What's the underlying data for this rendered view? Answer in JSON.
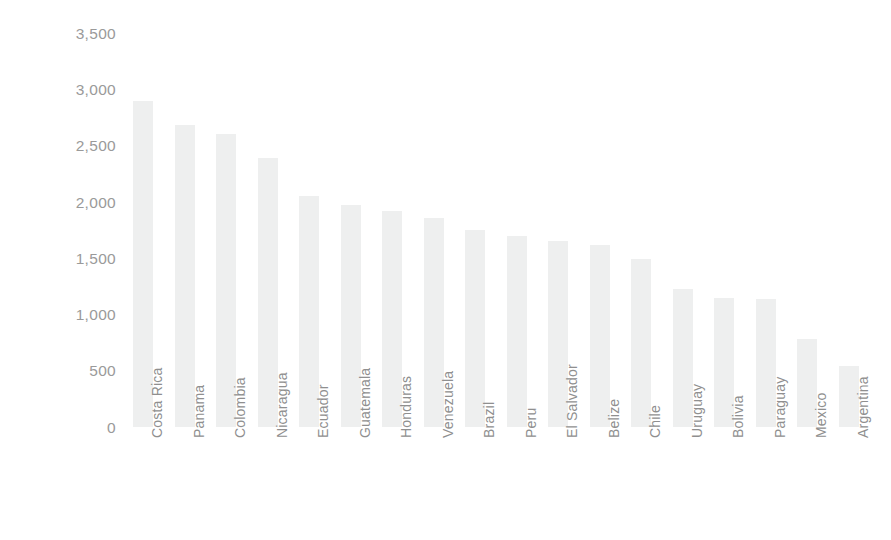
{
  "chart_data": {
    "type": "bar",
    "title": "",
    "xlabel": "",
    "ylabel": "Rainfall (mm/yr)",
    "ylim": [
      0,
      3500
    ],
    "ytick_step": 500,
    "grid": false,
    "legend": null,
    "orientation": "vertical",
    "bar_color": "#eeefef",
    "text_color": "#909090",
    "ytick_labels": [
      "3,500",
      "3,000",
      "2,500",
      "2,000",
      "1,500",
      "1,000",
      "500",
      "0"
    ],
    "ytick_values": [
      3500,
      3000,
      2500,
      2000,
      1500,
      1000,
      500,
      0
    ],
    "categories": [
      "Costa Rica",
      "Panama",
      "Colombia",
      "Nicaragua",
      "Ecuador",
      "Guatemala",
      "Honduras",
      "Venezuela",
      "Brazil",
      "Peru",
      "El Salvador",
      "Belize",
      "Chile",
      "Uruguay",
      "Bolivia",
      "Paraguay",
      "Mexico",
      "Argentina"
    ],
    "values": [
      2900,
      2690,
      2610,
      2400,
      2060,
      1980,
      1930,
      1860,
      1760,
      1700,
      1660,
      1620,
      1500,
      1230,
      1150,
      1140,
      790,
      550
    ]
  }
}
